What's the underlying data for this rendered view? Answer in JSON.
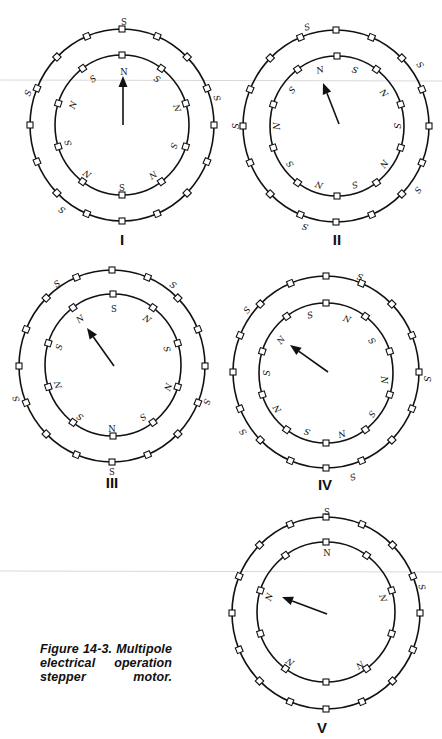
{
  "figure": {
    "caption_lines": [
      "Figure 14-3. Multipole",
      "electrical operation",
      "stepper motor."
    ],
    "colors": {
      "ink": "#111111",
      "background": "#ffffff"
    },
    "stator_teeth_count": 16,
    "rotor_teeth_count": 10
  },
  "diagrams": [
    {
      "id": "I",
      "numeral": "I",
      "numeral_pos": [
        122,
        245
      ],
      "outer": {
        "cx": 122,
        "cy": 125,
        "rx": 92,
        "ry": 96
      },
      "inner": {
        "cx": 122,
        "cy": 125,
        "rx": 67,
        "ry": 70
      },
      "arrow": {
        "from": [
          123,
          125
        ],
        "to": [
          123,
          76
        ]
      },
      "inner_labels": [
        {
          "t": "N",
          "x": 124,
          "y": 72,
          "r": 0,
          "upright": true
        },
        {
          "t": "S",
          "x": 93,
          "y": 79,
          "r": -35
        },
        {
          "t": "S",
          "x": 157,
          "y": 79,
          "r": 35
        },
        {
          "t": "N",
          "x": 73,
          "y": 105,
          "r": -70
        },
        {
          "t": "N",
          "x": 177,
          "y": 108,
          "r": 72
        },
        {
          "t": "S",
          "x": 68,
          "y": 143,
          "r": -108
        },
        {
          "t": "S",
          "x": 174,
          "y": 146,
          "r": 108
        },
        {
          "t": "N",
          "x": 87,
          "y": 174,
          "r": -145
        },
        {
          "t": "N",
          "x": 153,
          "y": 175,
          "r": 145
        },
        {
          "t": "S",
          "x": 122,
          "y": 188,
          "r": 0,
          "upright": true
        }
      ],
      "outer_labels": [
        {
          "t": "S",
          "x": 124,
          "y": 22,
          "r": 0,
          "upright": true
        },
        {
          "t": "S",
          "x": 28,
          "y": 93,
          "r": -70
        },
        {
          "t": "S",
          "x": 217,
          "y": 98,
          "r": 72
        },
        {
          "t": "S",
          "x": 62,
          "y": 210,
          "r": -145
        }
      ]
    },
    {
      "id": "II",
      "numeral": "II",
      "numeral_pos": [
        337,
        245
      ],
      "outer": {
        "cx": 336,
        "cy": 126,
        "rx": 93,
        "ry": 96
      },
      "inner": {
        "cx": 337,
        "cy": 126,
        "rx": 67,
        "ry": 70
      },
      "arrow": {
        "from": [
          339,
          124
        ],
        "to": [
          323,
          83
        ]
      },
      "inner_labels": [
        {
          "t": "N",
          "x": 320,
          "y": 70,
          "r": -15
        },
        {
          "t": "S",
          "x": 355,
          "y": 70,
          "r": 18
        },
        {
          "t": "S",
          "x": 292,
          "y": 90,
          "r": -50
        },
        {
          "t": "N",
          "x": 384,
          "y": 93,
          "r": 52
        },
        {
          "t": "N",
          "x": 277,
          "y": 126,
          "r": -90
        },
        {
          "t": "S",
          "x": 397,
          "y": 126,
          "r": 90
        },
        {
          "t": "S",
          "x": 290,
          "y": 164,
          "r": -125
        },
        {
          "t": "N",
          "x": 384,
          "y": 164,
          "r": 125
        },
        {
          "t": "N",
          "x": 319,
          "y": 185,
          "r": -162
        },
        {
          "t": "S",
          "x": 355,
          "y": 185,
          "r": 162
        }
      ],
      "outer_labels": [
        {
          "t": "S",
          "x": 307,
          "y": 27,
          "r": -18
        },
        {
          "t": "S",
          "x": 420,
          "y": 65,
          "r": 55
        },
        {
          "t": "S",
          "x": 236,
          "y": 126,
          "r": -90
        },
        {
          "t": "S",
          "x": 418,
          "y": 190,
          "r": 125
        },
        {
          "t": "S",
          "x": 305,
          "y": 227,
          "r": -162
        }
      ]
    },
    {
      "id": "III",
      "numeral": "III",
      "numeral_pos": [
        112,
        488
      ],
      "outer": {
        "cx": 112,
        "cy": 366,
        "rx": 93,
        "ry": 96
      },
      "inner": {
        "cx": 113,
        "cy": 365,
        "rx": 68,
        "ry": 71
      },
      "arrow": {
        "from": [
          114,
          366
        ],
        "to": [
          87,
          328
        ]
      },
      "inner_labels": [
        {
          "t": "S",
          "x": 114,
          "y": 309,
          "r": 0,
          "upright": true
        },
        {
          "t": "N",
          "x": 80,
          "y": 319,
          "r": -35
        },
        {
          "t": "N",
          "x": 147,
          "y": 319,
          "r": 35
        },
        {
          "t": "S",
          "x": 59,
          "y": 347,
          "r": -72
        },
        {
          "t": "S",
          "x": 167,
          "y": 349,
          "r": 72
        },
        {
          "t": "N",
          "x": 58,
          "y": 385,
          "r": -108
        },
        {
          "t": "N",
          "x": 168,
          "y": 387,
          "r": 108
        },
        {
          "t": "S",
          "x": 80,
          "y": 417,
          "r": -145
        },
        {
          "t": "S",
          "x": 143,
          "y": 417,
          "r": 145
        },
        {
          "t": "N",
          "x": 112,
          "y": 429,
          "r": 0,
          "upright": true
        }
      ],
      "outer_labels": [
        {
          "t": "S",
          "x": 57,
          "y": 284,
          "r": -35
        },
        {
          "t": "S",
          "x": 173,
          "y": 285,
          "r": 35
        },
        {
          "t": "S",
          "x": 16,
          "y": 399,
          "r": -108
        },
        {
          "t": "S",
          "x": 207,
          "y": 402,
          "r": 108
        },
        {
          "t": "S",
          "x": 112,
          "y": 472,
          "r": 0,
          "upright": true
        }
      ]
    },
    {
      "id": "IV",
      "numeral": "IV",
      "numeral_pos": [
        325,
        490
      ],
      "outer": {
        "cx": 326,
        "cy": 372,
        "rx": 93,
        "ry": 96
      },
      "inner": {
        "cx": 326,
        "cy": 373,
        "rx": 67,
        "ry": 70
      },
      "arrow": {
        "from": [
          328,
          372
        ],
        "to": [
          290,
          345
        ]
      },
      "inner_labels": [
        {
          "t": "S",
          "x": 310,
          "y": 315,
          "r": -15
        },
        {
          "t": "N",
          "x": 347,
          "y": 319,
          "r": 18
        },
        {
          "t": "N",
          "x": 281,
          "y": 340,
          "r": -52
        },
        {
          "t": "S",
          "x": 372,
          "y": 341,
          "r": 52
        },
        {
          "t": "S",
          "x": 267,
          "y": 373,
          "r": -90
        },
        {
          "t": "N",
          "x": 384,
          "y": 380,
          "r": 90
        },
        {
          "t": "N",
          "x": 277,
          "y": 409,
          "r": -125
        },
        {
          "t": "S",
          "x": 372,
          "y": 414,
          "r": 125
        },
        {
          "t": "S",
          "x": 307,
          "y": 432,
          "r": -162
        },
        {
          "t": "N",
          "x": 342,
          "y": 434,
          "r": 162
        }
      ],
      "outer_labels": [
        {
          "t": "S",
          "x": 360,
          "y": 277,
          "r": 18
        },
        {
          "t": "S",
          "x": 247,
          "y": 310,
          "r": -52
        },
        {
          "t": "S",
          "x": 427,
          "y": 379,
          "r": 90
        },
        {
          "t": "S",
          "x": 243,
          "y": 432,
          "r": -125
        },
        {
          "t": "S",
          "x": 353,
          "y": 477,
          "r": 162
        }
      ]
    },
    {
      "id": "V",
      "numeral": "V",
      "numeral_pos": [
        322,
        733
      ],
      "outer": {
        "cx": 326,
        "cy": 613,
        "rx": 94,
        "ry": 96
      },
      "inner": {
        "cx": 326,
        "cy": 612,
        "rx": 69,
        "ry": 70
      },
      "arrow": {
        "from": [
          327,
          614
        ],
        "to": [
          282,
          597
        ]
      },
      "inner_labels": [
        {
          "t": "N",
          "x": 327,
          "y": 553,
          "r": 0,
          "upright": true
        },
        {
          "t": "N",
          "x": 269,
          "y": 597,
          "r": -72
        },
        {
          "t": "N",
          "x": 383,
          "y": 598,
          "r": 72
        },
        {
          "t": "N",
          "x": 290,
          "y": 662,
          "r": -145
        },
        {
          "t": "N",
          "x": 360,
          "y": 665,
          "r": 145
        }
      ],
      "outer_labels": [
        {
          "t": "S",
          "x": 327,
          "y": 512,
          "r": 0,
          "upright": true
        },
        {
          "t": "S",
          "x": 422,
          "y": 587,
          "r": 72
        }
      ]
    }
  ]
}
